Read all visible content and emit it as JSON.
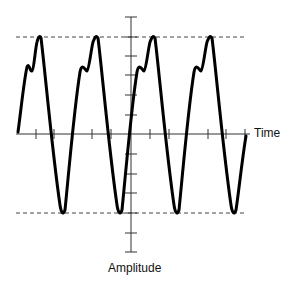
{
  "diagram": {
    "type": "periodic-waveform",
    "x_axis_label": "Time",
    "y_axis_label": "Amplitude",
    "reference_lines": [
      {
        "name": "positive-peak",
        "style": "dashed"
      },
      {
        "name": "negative-peak",
        "style": "dashed"
      }
    ],
    "cycles": 4,
    "waveform_description": "Periodic wave with a sharp positive peak preceded by a shoulder (notch) on the rising edge and a rounded negative trough; positive and negative peaks reach the dashed reference lines",
    "colors": {
      "waveform": "#000000",
      "axes": "#333333",
      "reference_lines": "#444444",
      "background": "#ffffff"
    }
  }
}
